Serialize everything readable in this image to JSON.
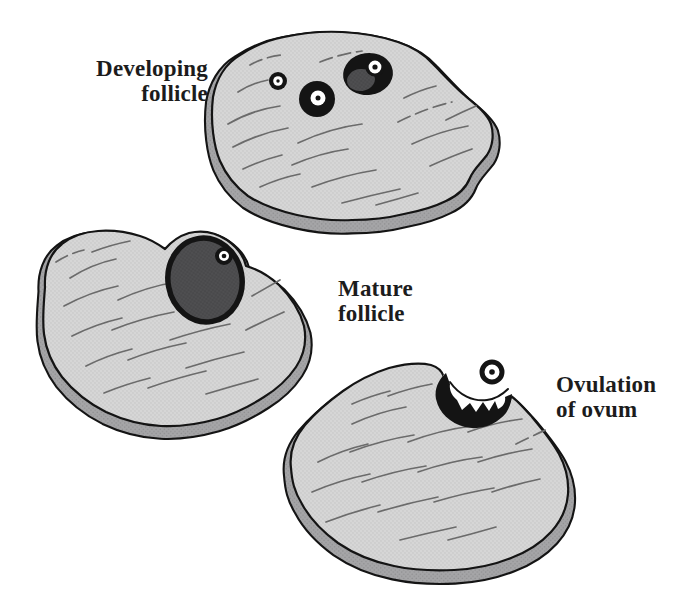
{
  "colors": {
    "background": "#ffffff",
    "surface": "#d6d6d6",
    "surface_dot": "#c2c2c2",
    "side": "#a5a5a7",
    "side_dot": "#8f8f91",
    "outline": "#141414",
    "follicle_dark": "#4f4f51",
    "follicle_dark_dot": "#3e3e40",
    "wrinkle": "#6b6b6b",
    "ovum_white": "#ffffff",
    "label_text": "#1c1c1c"
  },
  "labels": {
    "developing": {
      "line1": "Developing",
      "line2": "follicle"
    },
    "mature": {
      "line1": "Mature",
      "line2": "follicle"
    },
    "ovulation": {
      "line1": "Ovulation",
      "line2": "of ovum"
    }
  },
  "stages": [
    {
      "id": "developing-follicle",
      "label": "Developing follicle",
      "follicles_visible": 3,
      "ovum_released": false
    },
    {
      "id": "mature-follicle",
      "label": "Mature follicle",
      "follicles_visible": 1,
      "ovum_released": false
    },
    {
      "id": "ovulation-of-ovum",
      "label": "Ovulation of ovum",
      "follicles_visible": 1,
      "ovum_released": true
    }
  ]
}
